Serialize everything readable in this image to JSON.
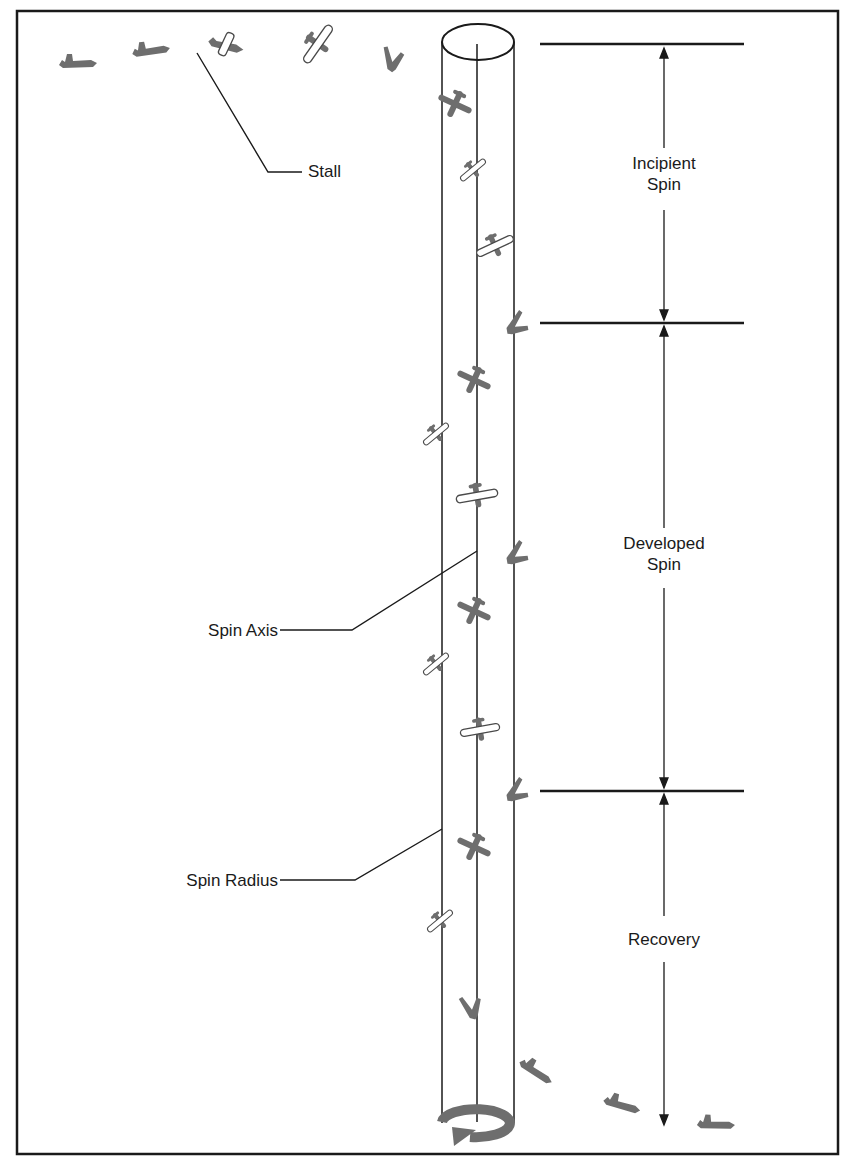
{
  "diagram": {
    "labels": {
      "stall": "Stall",
      "spin_axis": "Spin Axis",
      "spin_radius": "Spin Radius",
      "incipient_line1": "Incipient",
      "incipient_line2": "Spin",
      "developed_line1": "Developed",
      "developed_line2": "Spin",
      "recovery": "Recovery"
    },
    "phases": [
      {
        "name": "Incipient Spin",
        "top_y": 44,
        "bottom_y": 323
      },
      {
        "name": "Developed Spin",
        "top_y": 323,
        "bottom_y": 791
      },
      {
        "name": "Recovery",
        "top_y": 791,
        "bottom_y": 1128
      }
    ],
    "colors": {
      "line": "#1a1a1a",
      "aircraft_fill": "#6e6e6e",
      "aircraft_outline_fill": "#ffffff",
      "background": "#ffffff"
    },
    "icons": {
      "aircraft": "airplane-silhouette",
      "rotation": "circular-arrow-icon"
    }
  }
}
